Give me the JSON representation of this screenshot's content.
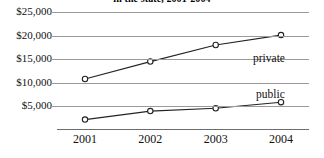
{
  "chart_data": {
    "type": "line",
    "title": "in the state, 2001-2004",
    "xlabel": "",
    "ylabel": "",
    "categories": [
      "2001",
      "2002",
      "2003",
      "2004"
    ],
    "x": [
      2001,
      2002,
      2003,
      2004
    ],
    "series": [
      {
        "name": "private",
        "values": [
          10800,
          14500,
          18000,
          20100
        ],
        "marker": "open-circle",
        "color": "#232323"
      },
      {
        "name": "public",
        "values": [
          2200,
          4000,
          4600,
          5900
        ],
        "marker": "open-circle",
        "color": "#232323"
      }
    ],
    "ylim": [
      0,
      25000
    ],
    "ytick_values": [
      5000,
      10000,
      15000,
      20000,
      25000
    ],
    "ytick_labels": [
      "$5,000",
      "$10,000",
      "$15,000",
      "$20,000",
      "$25,000"
    ],
    "xtick_labels": [
      "2001",
      "2002",
      "2003",
      "2004"
    ],
    "grid": true,
    "grid_color": "#9a9a9a",
    "legend_position": "inline-annotations",
    "background": "#ffffff"
  },
  "annotations": {
    "private_label": "private",
    "public_label": "public"
  }
}
